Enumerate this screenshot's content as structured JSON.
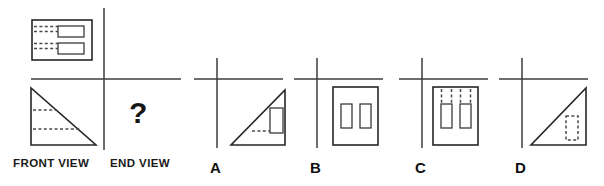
{
  "page": {
    "background_color": "#ffffff",
    "line_color": "#262626",
    "hidden_line_color": "#4a4a4a",
    "axis_color": "#3d3d3d"
  },
  "question": {
    "prompt_symbol": "?",
    "description": "Given the front view and plan view of a solid, select the correct end view."
  },
  "given_views": {
    "plan": {
      "name": "plan-view",
      "shape": "rectangle-with-two-inner-rectangles-and-hidden-lines",
      "inner_feature_count": 2,
      "hidden_line_count": 2
    },
    "front": {
      "label": "FRONT VIEW",
      "shape": "right-triangle-with-two-horizontal-hidden-lines",
      "right_angle_corner": "bottom-left",
      "hidden_line_count": 2
    },
    "end": {
      "label": "END VIEW",
      "shape": "unknown",
      "content": "?"
    }
  },
  "options": [
    {
      "label": "A",
      "name": "option-a",
      "shape": "right-triangle-right-angle-bottom-right-with-solid-rectangle-and-hidden-line",
      "visible_rectangle_count": 1,
      "hidden_line_count": 1
    },
    {
      "label": "B",
      "name": "option-b",
      "shape": "rectangle-with-two-solid-inner-vertical-rectangles",
      "visible_rectangle_count": 2,
      "hidden_line_count": 0
    },
    {
      "label": "C",
      "name": "option-c",
      "shape": "rectangle-with-two-inner-vertical-rectangles-and-four-vertical-hidden-lines",
      "visible_rectangle_count": 2,
      "hidden_line_count": 4
    },
    {
      "label": "D",
      "name": "option-d",
      "shape": "right-triangle-right-angle-bottom-right-with-hidden-rectangle",
      "visible_rectangle_count": 0,
      "hidden_line_count": 1
    }
  ]
}
